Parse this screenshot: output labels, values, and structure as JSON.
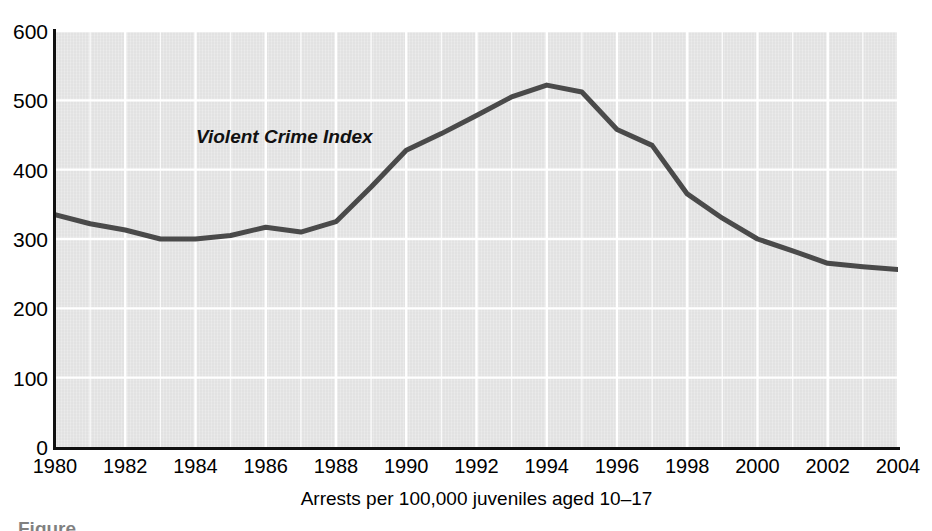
{
  "chart_data": {
    "type": "line",
    "title": "",
    "subtitle": "",
    "xlabel": "Arrests per 100,000 juveniles aged 10–17",
    "ylabel": "",
    "xlim": [
      1980,
      2004
    ],
    "ylim": [
      0,
      600
    ],
    "grid": true,
    "grid_color": "#ffffff",
    "plot_background": "#e2e2e2",
    "legend_position": "inline-annotation",
    "x_ticks": [
      1980,
      1982,
      1984,
      1986,
      1988,
      1990,
      1992,
      1994,
      1996,
      1998,
      2000,
      2002,
      2004
    ],
    "x_tick_labels": [
      "1980",
      "1982",
      "1984",
      "1986",
      "1988",
      "1990",
      "1992",
      "1994",
      "1996",
      "1998",
      "2000",
      "2002",
      "2004"
    ],
    "y_ticks": [
      0,
      100,
      200,
      300,
      400,
      500,
      600
    ],
    "y_tick_labels": [
      "0",
      "100",
      "200",
      "300",
      "400",
      "500",
      "600"
    ],
    "x_minor_step": 1,
    "series": [
      {
        "name": "Violent Crime Index",
        "color": "#4a4a4a",
        "line_width": 5,
        "annotation": "Violent Crime Index",
        "x": [
          1980,
          1981,
          1982,
          1983,
          1984,
          1985,
          1986,
          1987,
          1988,
          1989,
          1990,
          1991,
          1992,
          1993,
          1994,
          1995,
          1996,
          1997,
          1998,
          1999,
          2000,
          2001,
          2002,
          2003,
          2004
        ],
        "values": [
          335,
          322,
          313,
          300,
          300,
          305,
          317,
          310,
          325,
          375,
          428,
          452,
          478,
          505,
          522,
          512,
          458,
          435,
          365,
          330,
          300,
          283,
          265,
          260,
          256
        ]
      }
    ]
  },
  "axis": {
    "y_tick_labels": [
      "600",
      "500",
      "400",
      "300",
      "200",
      "100",
      "0"
    ],
    "x_tick_labels": [
      "1980",
      "1982",
      "1984",
      "1986",
      "1988",
      "1990",
      "1992",
      "1994",
      "1996",
      "1998",
      "2000",
      "2002",
      "2004"
    ],
    "x_title": "Arrests per 100,000 juveniles aged 10–17"
  },
  "annotations": {
    "series_label": "Violent Crime Index"
  },
  "caption": {
    "partial_text": "Figure"
  },
  "colors": {
    "line": "#4a4a4a",
    "plot_bg": "#e2e2e2",
    "grid": "#ffffff",
    "axis": "#111111",
    "page_bg": "#ffffff"
  }
}
